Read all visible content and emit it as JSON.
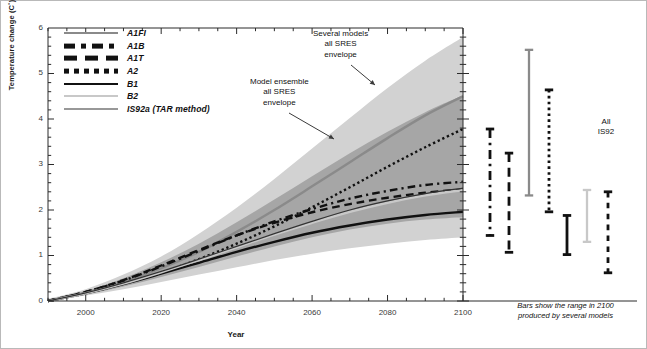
{
  "figure": {
    "border_color": "#b9b9b9",
    "background": "#ffffff"
  },
  "axes": {
    "ylabel": "Temperature change (C˚)",
    "xlabel": "Year",
    "y_ticks": [
      "0",
      "1",
      "2",
      "3",
      "4",
      "5",
      "6"
    ],
    "x_ticks": [
      "2000",
      "2020",
      "2040",
      "2060",
      "2080",
      "2100"
    ]
  },
  "legend": {
    "items": [
      {
        "label": "A1FI",
        "style": "solid",
        "color": "#8a8a8a",
        "width": 2.8
      },
      {
        "label": "A1B",
        "style": "dashdot",
        "color": "#111111",
        "width": 2.8
      },
      {
        "label": "A1T",
        "style": "longdash",
        "color": "#111111",
        "width": 2.8
      },
      {
        "label": "A2",
        "style": "dotted",
        "color": "#111111",
        "width": 2.8
      },
      {
        "label": "B1",
        "style": "solid",
        "color": "#111111",
        "width": 2.8
      },
      {
        "label": "B2",
        "style": "solid",
        "color": "#c8c8c8",
        "width": 2.8
      },
      {
        "label": "IS92a (TAR method)",
        "style": "solid",
        "color": "#333333",
        "width": 1.2
      }
    ]
  },
  "annotations": [
    {
      "name": "several-models-annotation",
      "lines": [
        "Several models",
        "all SRES",
        "envelope"
      ]
    },
    {
      "name": "model-ensemble-annotation",
      "lines": [
        "Model ensemble",
        "all SRES",
        "envelope"
      ]
    }
  ],
  "bars_panel": {
    "caption_lines": [
      "Bars show the range in 2100",
      "produced by several models"
    ],
    "is92_label_lines": [
      "All",
      "IS92"
    ]
  },
  "chart_data": {
    "type": "line",
    "title": "",
    "xlabel": "Year",
    "ylabel": "Temperature change (C˚)",
    "xlim": [
      1990,
      2100
    ],
    "ylim": [
      0,
      6
    ],
    "grid": false,
    "legend_position": "top-left",
    "x": [
      1990,
      2000,
      2010,
      2020,
      2030,
      2040,
      2050,
      2060,
      2070,
      2080,
      2090,
      2100
    ],
    "series": [
      {
        "name": "A1FI",
        "style": "solid",
        "color": "#8a8a8a",
        "values": [
          0.0,
          0.18,
          0.42,
          0.72,
          1.08,
          1.52,
          2.0,
          2.52,
          3.05,
          3.58,
          4.08,
          4.5
        ]
      },
      {
        "name": "A1B",
        "style": "dashdot",
        "color": "#111111",
        "values": [
          0.0,
          0.2,
          0.45,
          0.76,
          1.1,
          1.44,
          1.75,
          2.02,
          2.25,
          2.42,
          2.55,
          2.62
        ]
      },
      {
        "name": "A1T",
        "style": "longdash",
        "color": "#111111",
        "values": [
          0.0,
          0.2,
          0.46,
          0.78,
          1.12,
          1.44,
          1.72,
          1.95,
          2.13,
          2.27,
          2.38,
          2.45
        ]
      },
      {
        "name": "A2",
        "style": "dotted",
        "color": "#111111",
        "values": [
          0.0,
          0.17,
          0.38,
          0.62,
          0.92,
          1.26,
          1.64,
          2.06,
          2.5,
          2.95,
          3.38,
          3.78
        ]
      },
      {
        "name": "B1",
        "style": "solid",
        "color": "#111111",
        "values": [
          0.0,
          0.17,
          0.37,
          0.6,
          0.84,
          1.08,
          1.3,
          1.5,
          1.66,
          1.79,
          1.89,
          1.96
        ]
      },
      {
        "name": "B2",
        "style": "solid",
        "color": "#c8c8c8",
        "values": [
          0.0,
          0.17,
          0.38,
          0.63,
          0.9,
          1.18,
          1.46,
          1.72,
          1.96,
          2.16,
          2.32,
          2.44
        ]
      },
      {
        "name": "IS92a (TAR method)",
        "style": "solid",
        "color": "#333333",
        "values": [
          0.0,
          0.18,
          0.4,
          0.65,
          0.92,
          1.2,
          1.48,
          1.75,
          2.0,
          2.2,
          2.36,
          2.48
        ]
      }
    ],
    "envelopes": [
      {
        "name": "Several models all SRES envelope",
        "color": "#d2d2d2",
        "upper": [
          0.05,
          0.26,
          0.58,
          0.98,
          1.48,
          2.05,
          2.68,
          3.35,
          4.02,
          4.68,
          5.28,
          5.8
        ],
        "lower": [
          0.0,
          0.12,
          0.26,
          0.42,
          0.58,
          0.74,
          0.9,
          1.04,
          1.16,
          1.26,
          1.34,
          1.4
        ]
      },
      {
        "name": "Model ensemble all SRES envelope",
        "color": "#a6a6a6",
        "upper": [
          0.03,
          0.22,
          0.5,
          0.85,
          1.26,
          1.73,
          2.23,
          2.74,
          3.25,
          3.72,
          4.15,
          4.52
        ],
        "lower": [
          0.0,
          0.14,
          0.32,
          0.53,
          0.75,
          0.98,
          1.2,
          1.4,
          1.57,
          1.7,
          1.79,
          1.84
        ]
      }
    ],
    "range_bars_2100": [
      {
        "name": "A1B",
        "style": "dashdot",
        "color": "#111111",
        "low": 1.44,
        "high": 3.78
      },
      {
        "name": "A1T",
        "style": "longdash",
        "color": "#111111",
        "low": 1.07,
        "high": 3.25
      },
      {
        "name": "A1FI",
        "style": "solid",
        "color": "#8a8a8a",
        "low": 2.32,
        "high": 5.52
      },
      {
        "name": "A2",
        "style": "dotted",
        "color": "#111111",
        "low": 1.96,
        "high": 4.64
      },
      {
        "name": "B1",
        "style": "solid",
        "color": "#111111",
        "low": 1.02,
        "high": 1.88
      },
      {
        "name": "B2",
        "style": "solid",
        "color": "#c8c8c8",
        "low": 1.3,
        "high": 2.44
      },
      {
        "name": "All IS92",
        "style": "dashed",
        "color": "#111111",
        "low": 0.62,
        "high": 2.4
      }
    ]
  }
}
